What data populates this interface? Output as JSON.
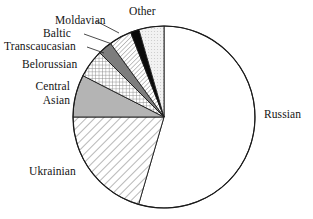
{
  "chart_data": {
    "type": "pie",
    "title": "",
    "subtitle": "",
    "xlabel": "",
    "ylabel": "",
    "legend_position": "callout-labels",
    "grid": false,
    "start_angle_deg": 0,
    "direction": "clockwise",
    "units": "percent of population",
    "categories": [
      "Russian",
      "Ukrainian",
      "Central Asian",
      "Belorussian",
      "Transcaucasian",
      "Baltic",
      "Moldavian",
      "Other"
    ],
    "values": [
      54.5,
      18.5,
      8.0,
      5.0,
      2.5,
      2.0,
      1.5,
      8.0
    ],
    "slices": [
      {
        "label": "Russian",
        "value": 54.5,
        "start_deg": 0,
        "end_deg": 196.2,
        "fill": "blank",
        "color": "#ffffff"
      },
      {
        "label": "Ukrainian",
        "value": 18.5,
        "start_deg": 196.2,
        "end_deg": 270.0,
        "fill": "diagonal-hatch",
        "color": "#ffffff"
      },
      {
        "label": "Central Asian",
        "value": 8.0,
        "start_deg": 270.0,
        "end_deg": 297.0,
        "fill": "solid-gray",
        "color": "#b4b4b4"
      },
      {
        "label": "Belorussian",
        "value": 5.0,
        "start_deg": 297.0,
        "end_deg": 315.0,
        "fill": "cross-hatch",
        "color": "#d8d8d8"
      },
      {
        "label": "Transcaucasian",
        "value": 2.5,
        "start_deg": 315.0,
        "end_deg": 324.0,
        "fill": "solid-dark-gray",
        "color": "#7d7d7d"
      },
      {
        "label": "Baltic",
        "value": 2.0,
        "start_deg": 324.0,
        "end_deg": 338.5,
        "fill": "fine-diagonal-hatch",
        "color": "#ffffff"
      },
      {
        "label": "Moldavian",
        "value": 1.5,
        "start_deg": 338.5,
        "end_deg": 344.0,
        "fill": "solid-black",
        "color": "#000000"
      },
      {
        "label": "Other",
        "value": 8.0,
        "start_deg": 344.0,
        "end_deg": 360.0,
        "fill": "light-dotted",
        "color": "#ededed"
      }
    ]
  },
  "labels": {
    "other": "Other",
    "moldavian": "Moldavian",
    "baltic": "Baltic",
    "transcaucasian": "Transcaucasian",
    "belorussian": "Belorussian",
    "central_asian_line1": "Central",
    "central_asian_line2": "Asian",
    "ukrainian": "Ukrainian",
    "russian": "Russian"
  },
  "style": {
    "outline_color": "#1a1a1a",
    "page_background": "#ffffff",
    "text_color": "#141414"
  }
}
